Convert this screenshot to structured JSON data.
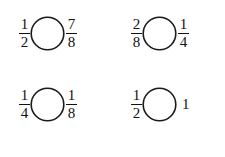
{
  "worksheet": {
    "title": "Fraction comparison exercises",
    "background_color": "#ffffff",
    "ink_color": "#111111",
    "circle_stroke_color": "#1a1a1a",
    "columns": 2,
    "rows": 2,
    "problems": [
      {
        "id": "problem-1",
        "left": {
          "type": "fraction",
          "numerator": "1",
          "denominator": "2",
          "text": "1/2"
        },
        "operator_placeholder": "circle",
        "right": {
          "type": "fraction",
          "numerator": "7",
          "denominator": "8",
          "text": "7/8"
        }
      },
      {
        "id": "problem-2",
        "left": {
          "type": "fraction",
          "numerator": "2",
          "denominator": "8",
          "text": "2/8"
        },
        "operator_placeholder": "circle",
        "right": {
          "type": "fraction",
          "numerator": "1",
          "denominator": "4",
          "text": "1/4"
        }
      },
      {
        "id": "problem-3",
        "left": {
          "type": "fraction",
          "numerator": "1",
          "denominator": "4",
          "text": "1/4"
        },
        "operator_placeholder": "circle",
        "right": {
          "type": "fraction",
          "numerator": "1",
          "denominator": "8",
          "text": "1/8"
        }
      },
      {
        "id": "problem-4",
        "left": {
          "type": "fraction",
          "numerator": "1",
          "denominator": "2",
          "text": "1/2"
        },
        "operator_placeholder": "circle",
        "right": {
          "type": "whole",
          "value": "1",
          "text": "1"
        }
      }
    ]
  }
}
